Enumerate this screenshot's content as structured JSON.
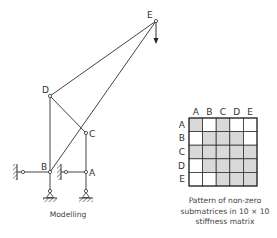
{
  "frame": {
    "nodes": [
      {
        "id": "A",
        "label": "A",
        "x": 86,
        "y": 172
      },
      {
        "id": "B",
        "label": "B",
        "x": 50,
        "y": 172
      },
      {
        "id": "C",
        "label": "C",
        "x": 86,
        "y": 133
      },
      {
        "id": "D",
        "label": "D",
        "x": 50,
        "y": 96
      },
      {
        "id": "E",
        "label": "E",
        "x": 156,
        "y": 21
      }
    ],
    "load": {
      "node": "E",
      "direction": "down"
    },
    "caption": "Modelling"
  },
  "matrix": {
    "col_labels": [
      "A",
      "B",
      "C",
      "D",
      "E"
    ],
    "row_labels": [
      "A",
      "B",
      "C",
      "D",
      "E"
    ],
    "pattern": [
      [
        1,
        0,
        1,
        0,
        0
      ],
      [
        0,
        1,
        1,
        1,
        0
      ],
      [
        1,
        1,
        1,
        1,
        1
      ],
      [
        0,
        1,
        1,
        1,
        1
      ],
      [
        0,
        0,
        1,
        1,
        1
      ]
    ],
    "shade_color": "#d9d9d9",
    "caption_lines": [
      "Pattern of non-zero",
      "submatrices in 10 × 10",
      "stiffness matrix"
    ]
  }
}
